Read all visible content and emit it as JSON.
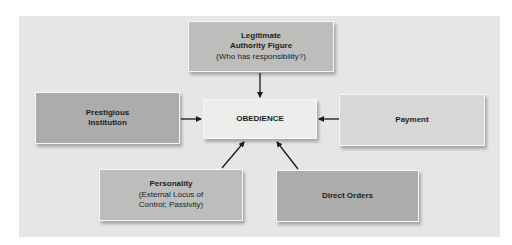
{
  "diagram": {
    "center": {
      "label": "OBEDIENCE"
    },
    "nodes": [
      {
        "id": "legitimate-authority",
        "title_line1": "Legitimate",
        "title_line2": "Authority Figure",
        "subtitle": "(Who has responsibility?)"
      },
      {
        "id": "prestigious-institution",
        "title_line1": "Prestigious",
        "title_line2": "Institution"
      },
      {
        "id": "payment",
        "title": "Payment"
      },
      {
        "id": "personality",
        "title": "Personality",
        "subtitle_line1": "(External Locus of",
        "subtitle_line2": "Control; Passivity)"
      },
      {
        "id": "direct-orders",
        "title": "Direct Orders"
      }
    ],
    "edges": [
      {
        "from": "legitimate-authority",
        "to": "obedience"
      },
      {
        "from": "prestigious-institution",
        "to": "obedience"
      },
      {
        "from": "payment",
        "to": "obedience"
      },
      {
        "from": "personality",
        "to": "obedience"
      },
      {
        "from": "direct-orders",
        "to": "obedience"
      }
    ],
    "colors": {
      "panel": "#e6e6e5",
      "dark_box": "#acacab",
      "mid_box": "#bdbdbc",
      "light_box": "#d7d7d6",
      "center_box": "#ededec",
      "arrow": "#1a1a1a"
    }
  }
}
